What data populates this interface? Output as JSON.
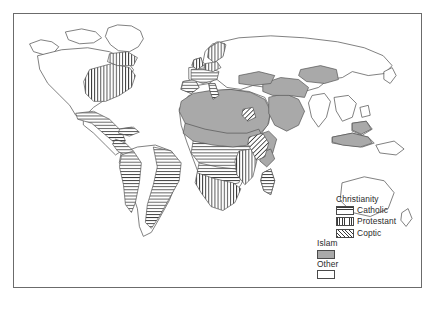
{
  "figure": {
    "kind": "thematic-world-map",
    "projection_note": "world map, land outlines only"
  },
  "legend": {
    "groups": [
      {
        "heading": "Christianity",
        "items": [
          {
            "label": "Catholic",
            "pattern": "horizontal-lines",
            "color": "#3a3a3a"
          },
          {
            "label": "Protestant",
            "pattern": "vertical-lines",
            "color": "#3a3a3a"
          },
          {
            "label": "Coptic",
            "pattern": "diagonal-lines",
            "color": "#3a3a3a"
          }
        ]
      }
    ],
    "standalone": [
      {
        "label": "Islam",
        "pattern": "solid-gray",
        "color": "#a9a9a9"
      },
      {
        "label": "Other",
        "pattern": "blank-white",
        "color": "#ffffff"
      }
    ]
  },
  "colors": {
    "frame": "#6b6b6b",
    "coastline": "#555555",
    "islam_fill": "#a9a9a9",
    "hatch": "#3a3a3a",
    "background": "#ffffff",
    "text": "#2b2b2b"
  },
  "map_regions": [
    {
      "name": "North Africa and Sahel",
      "religion": "Islam"
    },
    {
      "name": "Arabian Peninsula",
      "religion": "Islam"
    },
    {
      "name": "Middle East and Iran",
      "religion": "Islam"
    },
    {
      "name": "Central Asia",
      "religion": "Islam"
    },
    {
      "name": "Horn of Africa coast",
      "religion": "Islam"
    },
    {
      "name": "Indonesia and Malaysia",
      "religion": "Islam"
    },
    {
      "name": "Ethiopian Highlands",
      "religion": "Coptic"
    },
    {
      "name": "Eastern North America",
      "religion": "Protestant"
    },
    {
      "name": "Southern Africa",
      "religion": "Protestant"
    },
    {
      "name": "Northern Europe",
      "religion": "Protestant"
    },
    {
      "name": "Central Africa",
      "religion": "Catholic"
    },
    {
      "name": "Latin America coasts",
      "religion": "Catholic"
    },
    {
      "name": "Southern Europe",
      "religion": "Catholic"
    },
    {
      "name": "Madagascar",
      "religion": "Catholic"
    },
    {
      "name": "Rest of world",
      "religion": "Other"
    }
  ]
}
